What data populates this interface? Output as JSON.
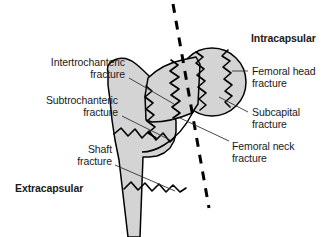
{
  "figure": {
    "colors": {
      "bone_fill": "#d4d4d4",
      "bone_outline": "#000000",
      "fracture_line": "#000000",
      "capsule_dashed_line": "#000000",
      "leader_line": "#333333",
      "text": "#1a1a1a",
      "background": "#ffffff"
    },
    "labels": {
      "intracapsular": "Intracapsular",
      "extracapsular": "Extracapsular",
      "intertrochanteric_line1": "Intertrochanteric",
      "intertrochanteric_line2": "fracture",
      "subtrochanteric_line1": "Subtrochanteric",
      "subtrochanteric_line2": "fracture",
      "shaft_line1": "Shaft",
      "shaft_line2": "fracture",
      "femoral_head_line1": "Femoral head",
      "femoral_head_line2": "fracture",
      "subcapital_line1": "Subcapital",
      "subcapital_line2": "fracture",
      "femoral_neck_line1": "Femoral neck",
      "femoral_neck_line2": "fracture"
    },
    "regions": [
      {
        "name": "intracapsular",
        "label": "Intracapsular",
        "bold": true
      },
      {
        "name": "extracapsular",
        "label": "Extracapsular",
        "bold": true
      }
    ],
    "fracture_types": [
      {
        "name": "femoral-head-fracture",
        "label": "Femoral head fracture",
        "side": "right"
      },
      {
        "name": "subcapital-fracture",
        "label": "Subcapital fracture",
        "side": "right"
      },
      {
        "name": "femoral-neck-fracture",
        "label": "Femoral neck fracture",
        "side": "right"
      },
      {
        "name": "intertrochanteric-fracture",
        "label": "Intertrochanteric fracture",
        "side": "left"
      },
      {
        "name": "subtrochanteric-fracture",
        "label": "Subtrochanteric fracture",
        "side": "left"
      },
      {
        "name": "shaft-fracture",
        "label": "Shaft fracture",
        "side": "left"
      }
    ]
  }
}
